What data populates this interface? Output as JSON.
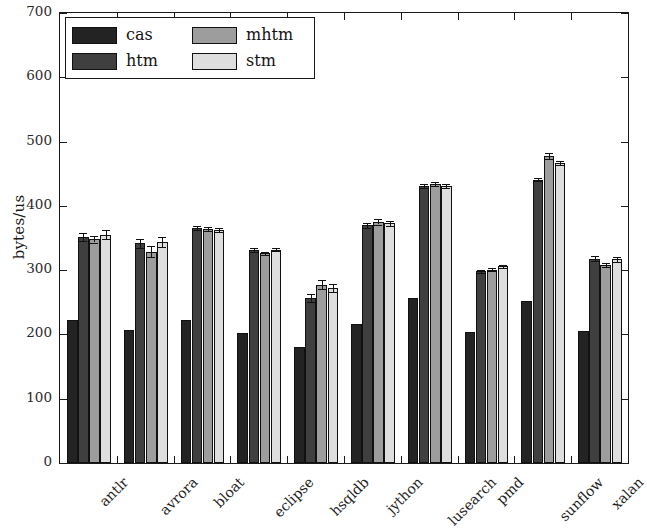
{
  "chart_data": {
    "type": "bar",
    "title": "",
    "subtitle": "",
    "xlabel": "",
    "ylabel": "bytes/us",
    "ylim": [
      0,
      700
    ],
    "yticks": [
      0,
      100,
      200,
      300,
      400,
      500,
      600,
      700
    ],
    "ytick_labels": [
      "0",
      "100",
      "200",
      "300",
      "400",
      "500",
      "600",
      "700"
    ],
    "grid": false,
    "legend_position": "upper left",
    "categories": [
      "antlr",
      "avrora",
      "bloat",
      "eclipse",
      "hsqldb",
      "jython",
      "lusearch",
      "pmd",
      "sunflow",
      "xalan"
    ],
    "series": [
      {
        "name": "cas",
        "color": "#232323",
        "values": [
          222,
          207,
          222,
          203,
          181,
          216,
          256,
          204,
          252,
          205
        ],
        "errors": [
          0,
          0,
          0,
          0,
          0,
          0,
          0,
          0,
          0,
          0
        ]
      },
      {
        "name": "htm",
        "color": "#3f3f3f",
        "values": [
          352,
          342,
          366,
          331,
          257,
          370,
          431,
          298,
          441,
          318
        ],
        "errors": [
          6,
          7,
          3,
          3,
          6,
          4,
          3,
          2,
          3,
          4
        ]
      },
      {
        "name": "mhtm",
        "color": "#9d9d9d",
        "values": [
          348,
          329,
          364,
          326,
          277,
          375,
          434,
          301,
          478,
          308
        ],
        "errors": [
          5,
          9,
          3,
          2,
          7,
          4,
          3,
          2,
          5,
          3
        ]
      },
      {
        "name": "stm",
        "color": "#dedede",
        "values": [
          355,
          344,
          362,
          332,
          272,
          373,
          431,
          306,
          467,
          317
        ],
        "errors": [
          7,
          8,
          3,
          2,
          6,
          4,
          3,
          2,
          3,
          4
        ]
      }
    ]
  },
  "legend": {
    "entries": [
      {
        "label": "cas"
      },
      {
        "label": "mhtm"
      },
      {
        "label": "htm"
      },
      {
        "label": "stm"
      }
    ]
  },
  "axes": {
    "y_axis_label": "bytes/us"
  }
}
